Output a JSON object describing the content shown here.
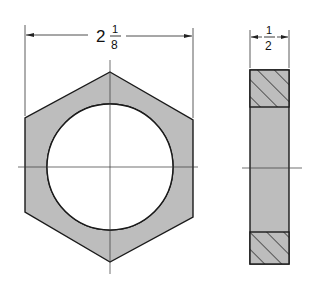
{
  "drawing": {
    "subject": "Hex nut (front and side views)",
    "front_view": {
      "width_dimension": {
        "whole": "2",
        "numerator": "1",
        "denominator": "8"
      }
    },
    "side_view": {
      "thickness_dimension": {
        "numerator": "1",
        "denominator": "2"
      }
    },
    "colors": {
      "fill": "#bdbdbd",
      "line": "#1a1a1a",
      "background": "#ffffff"
    }
  }
}
